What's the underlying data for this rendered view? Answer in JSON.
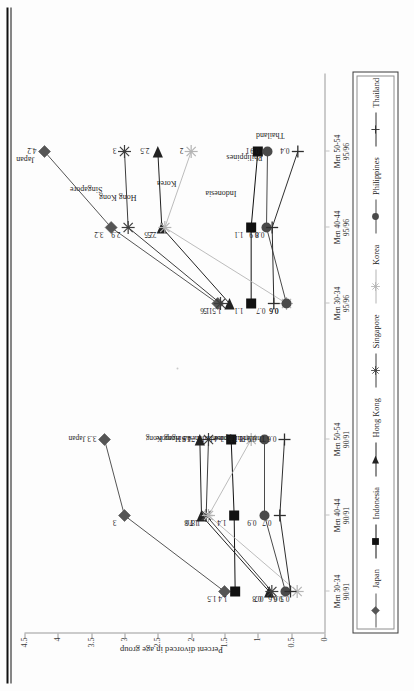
{
  "document": {
    "axis_title": "Percent divorced in age group",
    "rule_label": ""
  },
  "chart_data": {
    "type": "line",
    "title": "",
    "xlabel": "",
    "ylabel": "Percent divorced in age group",
    "ylim": [
      0,
      4.5
    ],
    "yticks": [
      "0",
      "0.5",
      "1",
      "1.5",
      "2",
      "2.5",
      "3",
      "3.5",
      "4",
      "4.5"
    ],
    "grid": false,
    "legend_position": "bottom",
    "categories": [
      "Men 30-34\n90/91",
      "Men 40-44\n90/91",
      "Men 50-54\n90/91",
      "Men 30-34\n95/96",
      "Men 40-44\n95/96",
      "Men 50-54\n95/96"
    ],
    "panels": [
      {
        "name": "panel-1990-91",
        "categories": [
          "Men 30-34",
          "Men 40-44",
          "Men 50-54"
        ],
        "period": "90/91",
        "tick_labels": [
          {
            "line1": "Men 30-34",
            "line2": "90/91"
          },
          {
            "line1": "Men 40-44",
            "line2": "90/91"
          },
          {
            "line1": "Men 50-54",
            "line2": "90/91"
          }
        ]
      },
      {
        "name": "panel-1995-96",
        "categories": [
          "Men 30-34",
          "Men 40-44",
          "Men 50-54"
        ],
        "period": "95/96",
        "tick_labels": [
          {
            "line1": "Men 30-34",
            "line2": "95/96"
          },
          {
            "line1": "Men 40-44",
            "line2": "95/96"
          },
          {
            "line1": "Men 50-54",
            "line2": "95/96"
          }
        ]
      }
    ],
    "series": [
      {
        "name": "Japan",
        "marker": "diamond",
        "color": "#555555",
        "values_90_91": [
          1.5,
          3,
          3.3
        ],
        "values_95_96": [
          1.6,
          3.2,
          4.2
        ],
        "labels_90_91": [
          "1.5",
          "3",
          "3.3 Japan"
        ],
        "labels_95_96": [
          "1.6",
          "3.2",
          "4.2"
        ]
      },
      {
        "name": "Indonesia",
        "marker": "square",
        "color": "#111111",
        "values_90_91": [
          1.4,
          1.4,
          1.4
        ],
        "values_95_96": [
          1.1,
          1.1,
          1.0
        ],
        "labels_90_91": [
          "1.4",
          "1.4",
          "1.4 Indonesia"
        ],
        "labels_95_96": [
          "1.1",
          "1.1",
          "1"
        ]
      },
      {
        "name": "Hong Kong",
        "marker": "triangle",
        "color": "#222222",
        "values_90_91": [
          0.8,
          1.8,
          1.9
        ],
        "values_95_96": [
          1.5,
          2.5,
          2.5
        ],
        "labels_90_91": [
          "0.8",
          "1.8",
          "1.9 Hong Kong"
        ],
        "labels_95_96": [
          "1.5",
          "2.5",
          "2.5"
        ]
      },
      {
        "name": "Singapore",
        "marker": "asterisk",
        "color": "#3d3d3d",
        "values_90_91": [
          0.7,
          1.76,
          1.74
        ],
        "values_95_96": [
          1.5,
          2.9,
          3.0
        ],
        "labels_90_91": [
          "0.7",
          "1.76",
          "1.74 Singapore"
        ],
        "labels_95_96": [
          "1.5",
          "2.9",
          "3"
        ]
      },
      {
        "name": "Korea",
        "marker": "star",
        "color": "#b4b4b4",
        "values_90_91": [
          0.5,
          1.8,
          1.1
        ],
        "values_95_96": [
          0.6,
          2.5,
          2.0
        ],
        "labels_90_91": [
          "0.5",
          "1.8",
          "1.1 Korea"
        ],
        "labels_95_96": [
          "0.6",
          "2.5",
          "2"
        ]
      },
      {
        "name": "Philippines",
        "marker": "circle",
        "color": "#4a4a4a",
        "values_90_91": [
          0.6,
          0.9,
          0.9
        ],
        "values_95_96": [
          0.6,
          0.9,
          0.9
        ],
        "labels_90_91": [
          "0.6",
          "0.9",
          "0.9 Philippines"
        ],
        "labels_95_96": [
          "0.6",
          "0.9",
          "0.9"
        ]
      },
      {
        "name": "Thailand",
        "marker": "plus",
        "color": "#2e2e2e",
        "values_90_91": [
          0.6,
          0.7,
          0.6
        ],
        "values_95_96": [
          0.7,
          0.8,
          0.4
        ],
        "labels_90_91": [
          "0.6",
          "0.7",
          "0.6 Thailand"
        ],
        "labels_95_96": [
          "0.7",
          "0.8",
          "0.4"
        ]
      }
    ],
    "annotations_panel2": [
      {
        "text": "Japan",
        "near": "Japan 50-54"
      },
      {
        "text": "Singapore",
        "near": "Singapore 50-54"
      },
      {
        "text": "Hong Kong",
        "near": "Hong Kong 50-54"
      },
      {
        "text": "Korea",
        "near": "Korea 50-54"
      },
      {
        "text": "Indonesia",
        "near": "Indonesia 50-54"
      },
      {
        "text": "Philippines",
        "near": "Philippines 50-54"
      },
      {
        "text": "Thailand",
        "near": "Thailand 50-54"
      }
    ]
  },
  "legend": {
    "items": [
      {
        "label": "Japan",
        "marker": "diamond",
        "color": "#555555"
      },
      {
        "label": "Indonesia",
        "marker": "square",
        "color": "#111111"
      },
      {
        "label": "Hong Kong",
        "marker": "triangle",
        "color": "#222222"
      },
      {
        "label": "Singapore",
        "marker": "asterisk",
        "color": "#3d3d3d"
      },
      {
        "label": "Korea",
        "marker": "star",
        "color": "#b4b4b4"
      },
      {
        "label": "Philippines",
        "marker": "circle",
        "color": "#4a4a4a"
      },
      {
        "label": "Thailand",
        "marker": "plus",
        "color": "#2e2e2e"
      }
    ]
  }
}
